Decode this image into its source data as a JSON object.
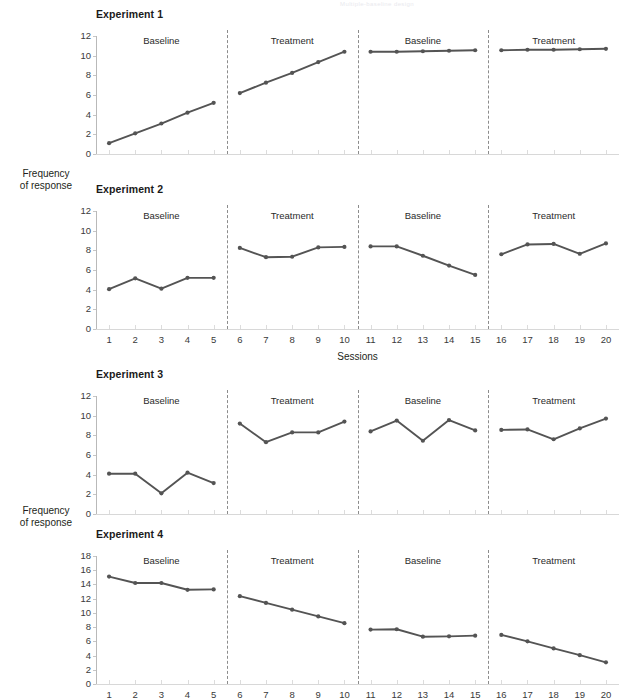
{
  "figure": {
    "top_fragment": "Multiple-baseline design",
    "y_axis_caption_line1": "Frequency",
    "y_axis_caption_line2": "of response",
    "x_axis_caption": "Sessions",
    "line_color": "#545454",
    "marker_color": "#545454",
    "divider_color": "#8c8c8c",
    "axis_color": "#c6c6c6"
  },
  "chart_data": [
    {
      "type": "line",
      "title": "Experiment 1",
      "xlabel": "Sessions",
      "ylabel": "Frequency of response",
      "xlim": [
        0.5,
        20.5
      ],
      "ylim": [
        0,
        12
      ],
      "yticks": [
        0,
        2,
        4,
        6,
        8,
        10,
        12
      ],
      "xticks": [
        1,
        2,
        3,
        4,
        5,
        6,
        7,
        8,
        9,
        10,
        11,
        12,
        13,
        14,
        15,
        16,
        17,
        18,
        19,
        20
      ],
      "show_xticklabels": false,
      "grid": false,
      "legend": "none",
      "phases": [
        {
          "label": "Baseline",
          "x": [
            1,
            2,
            3,
            4,
            5
          ],
          "values": [
            1.1,
            2.1,
            3.1,
            4.2,
            5.2
          ]
        },
        {
          "label": "Treatment",
          "x": [
            6,
            7,
            8,
            9,
            10
          ],
          "values": [
            6.2,
            7.25,
            8.25,
            9.35,
            10.4
          ]
        },
        {
          "label": "Baseline",
          "x": [
            11,
            12,
            13,
            14,
            15
          ],
          "values": [
            10.4,
            10.4,
            10.45,
            10.5,
            10.55
          ]
        },
        {
          "label": "Treatment",
          "x": [
            16,
            17,
            18,
            19,
            20
          ],
          "values": [
            10.55,
            10.6,
            10.6,
            10.65,
            10.7
          ]
        }
      ]
    },
    {
      "type": "line",
      "title": "Experiment 2",
      "xlabel": "Sessions",
      "ylabel": "Frequency of response",
      "xlim": [
        0.5,
        20.5
      ],
      "ylim": [
        0,
        12
      ],
      "yticks": [
        0,
        2,
        4,
        6,
        8,
        10,
        12
      ],
      "xticks": [
        1,
        2,
        3,
        4,
        5,
        6,
        7,
        8,
        9,
        10,
        11,
        12,
        13,
        14,
        15,
        16,
        17,
        18,
        19,
        20
      ],
      "show_xticklabels": true,
      "grid": false,
      "legend": "none",
      "phases": [
        {
          "label": "Baseline",
          "x": [
            1,
            2,
            3,
            4,
            5
          ],
          "values": [
            4.05,
            5.15,
            4.1,
            5.2,
            5.2
          ]
        },
        {
          "label": "Treatment",
          "x": [
            6,
            7,
            8,
            9,
            10
          ],
          "values": [
            8.25,
            7.3,
            7.35,
            8.3,
            8.35
          ]
        },
        {
          "label": "Baseline",
          "x": [
            11,
            12,
            13,
            14,
            15
          ],
          "values": [
            8.4,
            8.4,
            7.45,
            6.45,
            5.5
          ]
        },
        {
          "label": "Treatment",
          "x": [
            16,
            17,
            18,
            19,
            20
          ],
          "values": [
            7.6,
            8.6,
            8.65,
            7.65,
            8.7
          ]
        }
      ]
    },
    {
      "type": "line",
      "title": "Experiment 3",
      "xlabel": "Sessions",
      "ylabel": "Frequency of response",
      "xlim": [
        0.5,
        20.5
      ],
      "ylim": [
        0,
        12
      ],
      "yticks": [
        0,
        2,
        4,
        6,
        8,
        10,
        12
      ],
      "xticks": [
        1,
        2,
        3,
        4,
        5,
        6,
        7,
        8,
        9,
        10,
        11,
        12,
        13,
        14,
        15,
        16,
        17,
        18,
        19,
        20
      ],
      "show_xticklabels": false,
      "grid": false,
      "legend": "none",
      "phases": [
        {
          "label": "Baseline",
          "x": [
            1,
            2,
            3,
            4,
            5
          ],
          "values": [
            4.1,
            4.1,
            2.1,
            4.2,
            3.15
          ]
        },
        {
          "label": "Treatment",
          "x": [
            6,
            7,
            8,
            9,
            10
          ],
          "values": [
            9.2,
            7.3,
            8.3,
            8.3,
            9.4
          ]
        },
        {
          "label": "Baseline",
          "x": [
            11,
            12,
            13,
            14,
            15
          ],
          "values": [
            8.4,
            9.5,
            7.45,
            9.55,
            8.5
          ]
        },
        {
          "label": "Treatment",
          "x": [
            16,
            17,
            18,
            19,
            20
          ],
          "values": [
            8.55,
            8.6,
            7.6,
            8.7,
            9.7
          ]
        }
      ]
    },
    {
      "type": "line",
      "title": "Experiment 4",
      "xlabel": "Sessions",
      "ylabel": "Frequency of response",
      "xlim": [
        0.5,
        20.5
      ],
      "ylim": [
        0,
        18
      ],
      "yticks": [
        0,
        2,
        4,
        6,
        8,
        10,
        12,
        14,
        16,
        18
      ],
      "xticks": [
        1,
        2,
        3,
        4,
        5,
        6,
        7,
        8,
        9,
        10,
        11,
        12,
        13,
        14,
        15,
        16,
        17,
        18,
        19,
        20
      ],
      "show_xticklabels": true,
      "grid": false,
      "legend": "none",
      "phases": [
        {
          "label": "Baseline",
          "x": [
            1,
            2,
            3,
            4,
            5
          ],
          "values": [
            15.1,
            14.2,
            14.2,
            13.25,
            13.3
          ]
        },
        {
          "label": "Treatment",
          "x": [
            6,
            7,
            8,
            9,
            10
          ],
          "values": [
            12.35,
            11.4,
            10.45,
            9.5,
            8.55
          ]
        },
        {
          "label": "Baseline",
          "x": [
            11,
            12,
            13,
            14,
            15
          ],
          "values": [
            7.65,
            7.7,
            6.65,
            6.7,
            6.8
          ]
        },
        {
          "label": "Treatment",
          "x": [
            16,
            17,
            18,
            19,
            20
          ],
          "values": [
            6.9,
            6.0,
            5.0,
            4.05,
            3.05
          ]
        }
      ]
    }
  ]
}
